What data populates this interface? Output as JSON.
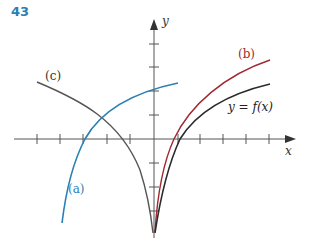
{
  "exercise": {
    "number": "43"
  },
  "axes": {
    "x_label": "x",
    "y_label": "y",
    "origin_px": [
      154,
      139
    ],
    "unit_px_approx": 23.5,
    "x_ticks_left_px": [
      37,
      60,
      83,
      107,
      130
    ],
    "x_ticks_right_px": [
      178,
      200,
      223,
      246,
      269
    ],
    "y_ticks_up_px": [
      44,
      67,
      91,
      115
    ],
    "y_ticks_down_px": [
      163,
      187,
      211
    ],
    "tick_positions_note": "tick spacing estimated from zooms, not every tick measured individually"
  },
  "curves": [
    {
      "id": "f",
      "label": "y = f(x)",
      "color": "#2b2b2b"
    },
    {
      "id": "a",
      "label": "(a)",
      "color": "#2a7fb5"
    },
    {
      "id": "b",
      "label": "(b)",
      "color": "#a0282e"
    },
    {
      "id": "c",
      "label": "(c)",
      "color": "#555555"
    }
  ],
  "colors": {
    "axis": "#555555",
    "exercise_number": "#2a7fb5"
  },
  "notes": {
    "curve_geometry": "curve paths are hand-fitted bezier approximations of the traced shapes, not exact",
    "interpretation": "reading of the figure as a transformations exercise (reflection, shift) is an inference, not stated in the image"
  }
}
